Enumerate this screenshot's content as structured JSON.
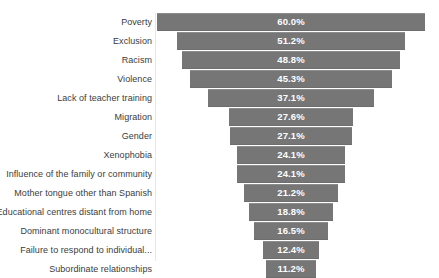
{
  "chart_data": {
    "type": "bar",
    "title": "",
    "subtitle": "",
    "xlabel": "",
    "ylabel": "",
    "grid": false,
    "legend": "none",
    "orientation": "horizontal-funnel",
    "axis_style": "centered funnel, bars centered on a common vertical axis",
    "bar_color": "#767676",
    "label_color": "#ffffff",
    "category_label_color": "#3c3c3c",
    "xlim": [
      0,
      60
    ],
    "categories": [
      "Poverty",
      "Exclusion",
      "Racism",
      "Violence",
      "Lack of teacher training",
      "Migration",
      "Gender",
      "Xenophobia",
      "Influence of the family or community",
      "Mother tongue other than Spanish",
      "Educational centres distant from home",
      "Dominant monocultural structure",
      "Failure to respond to individual...",
      "Subordinate relationships"
    ],
    "values": [
      60.0,
      51.2,
      48.8,
      45.3,
      37.1,
      27.6,
      27.1,
      24.1,
      24.1,
      21.2,
      18.8,
      16.5,
      12.4,
      11.2
    ],
    "value_labels": [
      "60.0%",
      "51.2%",
      "48.8%",
      "45.3%",
      "37.1%",
      "27.6%",
      "27.1%",
      "24.1%",
      "24.1%",
      "21.2%",
      "18.8%",
      "16.5%",
      "12.4%",
      "11.2%"
    ]
  }
}
